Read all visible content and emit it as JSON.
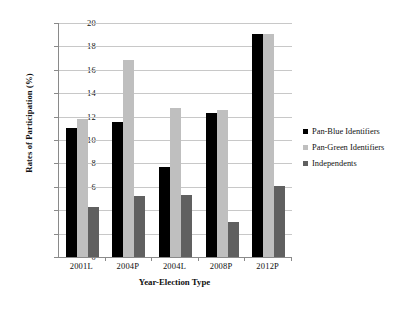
{
  "chart_data": {
    "type": "bar",
    "title": "",
    "xlabel": "Year-Election Type",
    "ylabel": "Rates of Participation (%)",
    "categories": [
      "2001L",
      "2004P",
      "2004L",
      "2008P",
      "2012P"
    ],
    "series": [
      {
        "name": "Pan-Blue Identifiers",
        "color": "#000000",
        "values": [
          11.0,
          11.5,
          7.7,
          12.3,
          19.1
        ]
      },
      {
        "name": "Pan-Green Identifiers",
        "color": "#bfbfbf",
        "values": [
          11.8,
          16.8,
          12.7,
          12.6,
          19.1
        ]
      },
      {
        "name": "Independents",
        "color": "#606060",
        "values": [
          4.3,
          5.2,
          5.3,
          3.0,
          6.1
        ]
      }
    ],
    "ylim": [
      0,
      20
    ],
    "yticks": [
      0,
      2,
      4,
      6,
      8,
      10,
      12,
      14,
      16,
      18,
      20
    ],
    "ytick_labels": [
      "0",
      "2",
      "4",
      "6",
      "8",
      "10",
      "12",
      "14",
      "16",
      "18",
      "20"
    ],
    "grid": true,
    "legend_position": "right"
  }
}
